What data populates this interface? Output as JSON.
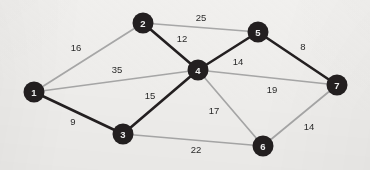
{
  "figure": {
    "type": "weighted-undirected-graph",
    "background_color": "#f1f0ee",
    "node_fill": "#231f20",
    "node_label_color": "#f3f3f3",
    "edge_highlight_color": "#231f20",
    "edge_normal_color": "#a8a8a8",
    "node_radius": 10.5
  },
  "chart_data": {
    "type": "graph",
    "title": "",
    "nodes": [
      {
        "id": "1",
        "label": "1",
        "x": 34,
        "y": 92
      },
      {
        "id": "2",
        "label": "2",
        "x": 143,
        "y": 23
      },
      {
        "id": "3",
        "label": "3",
        "x": 123,
        "y": 134
      },
      {
        "id": "4",
        "label": "4",
        "x": 198,
        "y": 70
      },
      {
        "id": "5",
        "label": "5",
        "x": 258,
        "y": 32
      },
      {
        "id": "6",
        "label": "6",
        "x": 263,
        "y": 146
      },
      {
        "id": "7",
        "label": "7",
        "x": 337,
        "y": 85
      }
    ],
    "edges": [
      {
        "source": "1",
        "target": "2",
        "weight": 16,
        "label": "16",
        "style": "normal",
        "lx": 76,
        "ly": 48
      },
      {
        "source": "1",
        "target": "4",
        "weight": 35,
        "label": "35",
        "style": "normal",
        "lx": 117,
        "ly": 70
      },
      {
        "source": "1",
        "target": "3",
        "weight": 9,
        "label": "9",
        "style": "highlight",
        "lx": 73,
        "ly": 122
      },
      {
        "source": "2",
        "target": "5",
        "weight": 25,
        "label": "25",
        "style": "normal",
        "lx": 201,
        "ly": 18
      },
      {
        "source": "2",
        "target": "4",
        "weight": 12,
        "label": "12",
        "style": "highlight",
        "lx": 182,
        "ly": 39
      },
      {
        "source": "3",
        "target": "4",
        "weight": 15,
        "label": "15",
        "style": "highlight",
        "lx": 150,
        "ly": 96
      },
      {
        "source": "3",
        "target": "6",
        "weight": 22,
        "label": "22",
        "style": "normal",
        "lx": 196,
        "ly": 150
      },
      {
        "source": "4",
        "target": "5",
        "weight": 14,
        "label": "14",
        "style": "highlight",
        "lx": 238,
        "ly": 62
      },
      {
        "source": "4",
        "target": "7",
        "weight": 19,
        "label": "19",
        "style": "normal",
        "lx": 272,
        "ly": 90
      },
      {
        "source": "4",
        "target": "6",
        "weight": 17,
        "label": "17",
        "style": "normal",
        "lx": 214,
        "ly": 111
      },
      {
        "source": "5",
        "target": "7",
        "weight": 8,
        "label": "8",
        "style": "highlight",
        "lx": 303,
        "ly": 47
      },
      {
        "source": "6",
        "target": "7",
        "weight": 14,
        "label": "14",
        "style": "normal",
        "lx": 309,
        "ly": 127
      }
    ]
  }
}
